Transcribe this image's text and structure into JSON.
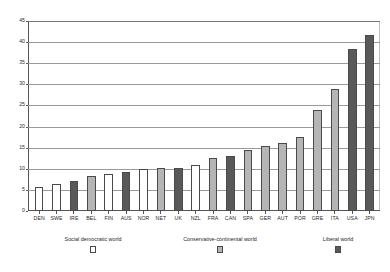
{
  "chart_data": {
    "type": "bar",
    "title": "",
    "xlabel": "",
    "ylabel": "",
    "ylim": [
      0,
      45
    ],
    "yticks": [
      0,
      5,
      10,
      15,
      20,
      25,
      30,
      35,
      40,
      45
    ],
    "grid": true,
    "legend_position": "bottom",
    "categories": [
      "DEN",
      "SWE",
      "IRE",
      "BEL",
      "FIN",
      "AUS",
      "NOR",
      "NET",
      "UK",
      "NZL",
      "FRA",
      "CAN",
      "SPA",
      "GER",
      "AUT",
      "POR",
      "GRE",
      "ITA",
      "USA",
      "JPN"
    ],
    "values": [
      5.7,
      6.3,
      7.0,
      8.2,
      8.8,
      9.2,
      10.0,
      10.1,
      10.3,
      10.9,
      12.5,
      13.0,
      14.5,
      15.5,
      16.0,
      17.5,
      24.0,
      28.8,
      38.3,
      41.8
    ],
    "groups": [
      "social",
      "social",
      "liberal",
      "conservative",
      "social",
      "liberal",
      "social",
      "conservative",
      "liberal",
      "social",
      "conservative",
      "liberal",
      "conservative",
      "conservative",
      "conservative",
      "conservative",
      "conservative",
      "conservative",
      "liberal",
      "liberal"
    ],
    "legend": [
      {
        "label": "Social democratic world",
        "key": "social",
        "color": "#ffffff"
      },
      {
        "label": "Conservative-continental world",
        "key": "conservative",
        "color": "#b5b5b5"
      },
      {
        "label": "Liberal world",
        "key": "liberal",
        "color": "#595959"
      }
    ]
  }
}
